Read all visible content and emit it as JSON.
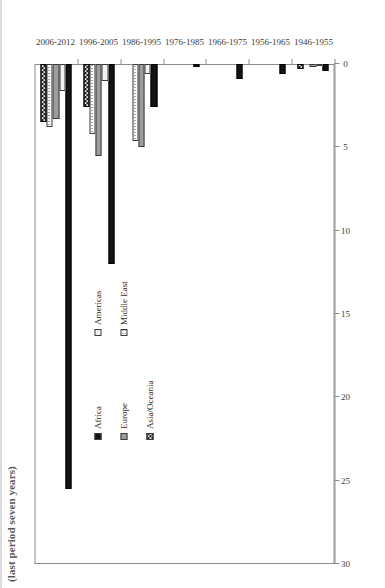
{
  "title_fragment": "(last period seven years)",
  "axis": {
    "value_ticks": [
      "0",
      "5",
      "10",
      "15",
      "20",
      "25",
      "30"
    ],
    "value_min": 0,
    "value_max": 30,
    "value_step": 5
  },
  "legend": {
    "items": [
      {
        "label": "Africa",
        "key": "africa",
        "pattern": "solid-black"
      },
      {
        "label": "Americas",
        "key": "americas",
        "pattern": "white-outline"
      },
      {
        "label": "Europe",
        "key": "europe",
        "pattern": "solid-gray"
      },
      {
        "label": "Middle East",
        "key": "middleeast",
        "pattern": "dotted"
      },
      {
        "label": "Asia/Oceania",
        "key": "asiaoceania",
        "pattern": "checkered"
      }
    ]
  },
  "chart_data": {
    "type": "bar",
    "orientation": "horizontal",
    "title": "(last period seven years)",
    "xlabel": "",
    "ylabel": "",
    "ylim": [
      0,
      30
    ],
    "grid": false,
    "legend_position": "inside-left",
    "categories": [
      "1946-1955",
      "1956-1965",
      "1966-1975",
      "1976-1985",
      "1986-1995",
      "1996-2005",
      "2006-2012"
    ],
    "series": [
      {
        "name": "Africa",
        "values": [
          0.4,
          0.6,
          0.9,
          0.2,
          2.6,
          12.0,
          25.5
        ]
      },
      {
        "name": "Americas",
        "values": [
          0.1,
          0.0,
          0.0,
          0.0,
          0.6,
          1.0,
          1.6
        ]
      },
      {
        "name": "Europe",
        "values": [
          0.2,
          0.0,
          0.0,
          0.0,
          5.0,
          5.5,
          3.3
        ]
      },
      {
        "name": "Middle East",
        "values": [
          0.0,
          0.0,
          0.0,
          0.0,
          4.6,
          4.2,
          3.8
        ]
      },
      {
        "name": "Asia/Oceania",
        "values": [
          0.3,
          0.0,
          0.0,
          0.0,
          0.0,
          2.6,
          3.5
        ]
      }
    ]
  }
}
